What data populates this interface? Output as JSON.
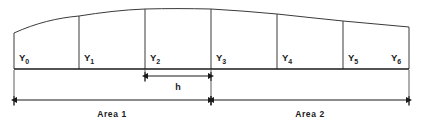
{
  "diagram": {
    "ordinates": [
      {
        "id": "y0",
        "label": "Y",
        "subscript": "0",
        "x": 14,
        "top": 33
      },
      {
        "id": "y1",
        "label": "Y",
        "subscript": "1",
        "x": 79,
        "top": 16
      },
      {
        "id": "y2",
        "label": "Y",
        "subscript": "2",
        "x": 145,
        "top": 9
      },
      {
        "id": "y3",
        "label": "Y",
        "subscript": "3",
        "x": 211,
        "top": 9
      },
      {
        "id": "y4",
        "label": "Y",
        "subscript": "4",
        "x": 277,
        "top": 14
      },
      {
        "id": "y5",
        "label": "Y",
        "subscript": "5",
        "x": 343,
        "top": 21
      },
      {
        "id": "y6",
        "label": "Y",
        "subscript": "6",
        "x": 409,
        "top": 27
      }
    ],
    "baseline_y": 69,
    "spacing_label": "h",
    "spacing_from_x": 145,
    "spacing_to_x": 211,
    "spacing_line_y": 76,
    "areas": [
      {
        "id": "area1",
        "label": "Area 1",
        "from_x": 14,
        "to_x": 211
      },
      {
        "id": "area2",
        "label": "Area 2",
        "from_x": 211,
        "to_x": 409
      }
    ],
    "area_line_y": 100,
    "colors": {
      "curve": "#3a3a3a",
      "baseline": "#1a1a1a",
      "dimension": "#1a1a1a",
      "text": "#1a1a1a",
      "background": "#ffffff"
    }
  }
}
